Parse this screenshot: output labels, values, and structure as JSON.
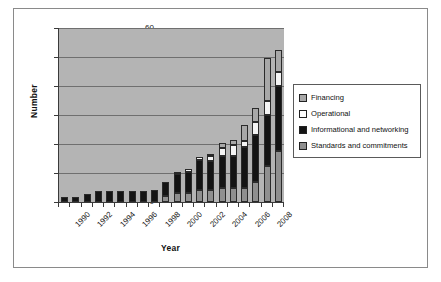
{
  "chart_data": {
    "type": "bar",
    "subtype": "stacked-bar",
    "title": "",
    "xlabel": "Year",
    "ylabel": "Number",
    "ylim": [
      0,
      60
    ],
    "yticks": [
      0,
      10,
      20,
      30,
      40,
      50,
      60
    ],
    "grid": true,
    "legend_position": "right",
    "plot_background": "#b4b4b4",
    "categories": [
      "1990",
      "1991",
      "1992",
      "1993",
      "1994",
      "1995",
      "1996",
      "1997",
      "1998",
      "1999",
      "2000",
      "2001",
      "2002",
      "2003",
      "2004",
      "2005",
      "2006",
      "2007",
      "2008",
      "2009"
    ],
    "tick_labels_shown": [
      "1990",
      "1992",
      "1994",
      "1996",
      "1998",
      "2000",
      "2002",
      "2004",
      "2006",
      "2008"
    ],
    "series": [
      {
        "name": "Standards and commitments",
        "color": "#8f8f8f",
        "values": [
          0,
          0,
          0,
          0,
          0,
          0,
          0,
          0,
          0,
          2,
          3,
          3,
          4,
          4,
          5,
          5,
          5,
          7,
          12.5,
          17.5
        ]
      },
      {
        "name": "Informational and networking",
        "color": "#141414",
        "values": [
          1.8,
          1.6,
          2.6,
          3.8,
          3.8,
          3.8,
          3.8,
          3.8,
          4,
          5,
          6.5,
          7.5,
          10.5,
          10,
          11,
          11,
          14,
          16,
          17.5,
          22.5
        ]
      },
      {
        "name": "Operational",
        "color": "#f4f4f4",
        "values": [
          0,
          0,
          0,
          0,
          0,
          0,
          0,
          0,
          0,
          0,
          0.5,
          1,
          1,
          2,
          2.5,
          3.5,
          2,
          4.5,
          5,
          5
        ]
      },
      {
        "name": "Financing",
        "color": "#a8a8a8",
        "values": [
          0,
          0,
          0,
          0,
          0,
          0,
          0,
          0,
          0,
          0,
          0,
          0,
          0,
          0.5,
          2,
          2,
          5.5,
          5,
          14.5,
          7.5
        ]
      }
    ],
    "totals": [
      1.8,
      1.6,
      2.6,
      3.8,
      3.8,
      3.8,
      3.8,
      3.8,
      4,
      7,
      10,
      11.5,
      15.5,
      16.5,
      20.5,
      21.5,
      26.5,
      32.5,
      41.5,
      52.5
    ]
  },
  "legend": {
    "items": [
      {
        "label": "Financing",
        "swatch": "#a8a8a8"
      },
      {
        "label": "Operational",
        "swatch": "#ffffff"
      },
      {
        "label": "Informational and networking",
        "swatch": "#141414"
      },
      {
        "label": "Standards and commitments",
        "swatch": "#8f8f8f"
      }
    ]
  }
}
